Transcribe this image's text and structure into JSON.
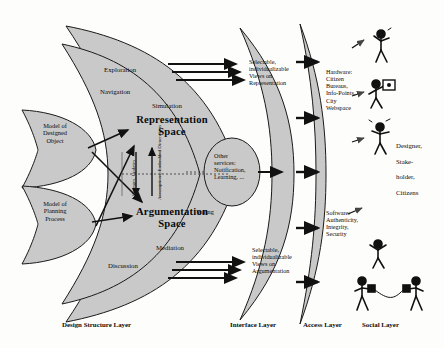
{
  "diagram": {
    "colors": {
      "fill": "#c9c9c9",
      "stroke": "#1a1a1a",
      "background": "#fdfdfc",
      "text": "#0b0b0b"
    },
    "design_structure_layer": {
      "models": [
        {
          "label": "Model of\nDesigned\nObject"
        },
        {
          "label": "Model of\nPlanning\nProcess"
        }
      ],
      "spaces": [
        {
          "label": "Representation\nSpace"
        },
        {
          "label": "Argumentation\nSpace"
        }
      ],
      "representation_activities": [
        {
          "label": "Exploration"
        },
        {
          "label": "Navigation"
        },
        {
          "label": "Simulation"
        }
      ],
      "argumentation_activities": [
        {
          "label": "Voting"
        },
        {
          "label": "Mediation"
        },
        {
          "label": "Discussion"
        }
      ],
      "axis_labels": [
        {
          "label": "Changes, Updates"
        },
        {
          "label": "Assumptions, Embedded Dimensions"
        }
      ],
      "other_services": {
        "label": "Other\nservices:\nNotification,\nLearning, ..."
      }
    },
    "interface_layer": {
      "views": [
        {
          "label": "Selectable,\nindividualizable\nViews on\nRepresentation"
        },
        {
          "label": "Selectable,\nindividualizable\nViews on\nArgumentation"
        }
      ]
    },
    "access_layer": {
      "blocks": [
        {
          "label": "Hardware:\nCitizen\nBureaus,\nInfo-Points,\nCity\nWebspace"
        },
        {
          "label": "Software:\nAuthenticity,\nIntegrity,\nSecurity"
        }
      ]
    },
    "social_layer": {
      "actors": {
        "label": "Designer,\n\nStake-\n\nholder,\n\nCitizens"
      }
    },
    "layer_captions": [
      {
        "label": "Design Structure Layer"
      },
      {
        "label": "Interface Layer"
      },
      {
        "label": "Access Layer"
      },
      {
        "label": "Social Layer"
      }
    ]
  }
}
